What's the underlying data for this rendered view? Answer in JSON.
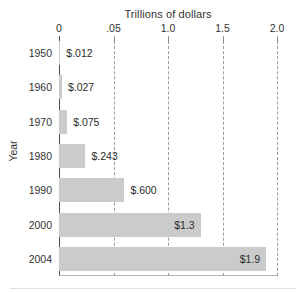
{
  "chart_data": {
    "type": "bar",
    "orientation": "horizontal",
    "title": "Trillions of dollars",
    "xlabel": "Trillions of dollars",
    "ylabel": "Year",
    "categories": [
      "1950",
      "1960",
      "1970",
      "1980",
      "1990",
      "2000",
      "2004"
    ],
    "values": [
      0.012,
      0.027,
      0.075,
      0.243,
      0.6,
      1.3,
      1.9
    ],
    "value_labels": [
      "$.012",
      "$.027",
      "$.075",
      "$.243",
      "$.600",
      "$1.3",
      "$1.9"
    ],
    "label_placement": [
      "outside",
      "outside",
      "outside",
      "outside",
      "outside",
      "inside",
      "inside"
    ],
    "xlim": [
      0,
      2.0
    ],
    "xticks": [
      0,
      0.5,
      1.0,
      1.5,
      2.0
    ],
    "xtick_labels": [
      "0",
      ".05",
      "1.0",
      "1.5",
      "2.0"
    ],
    "grid": true,
    "grid_style": "dashed",
    "legend": "none",
    "bar_color": "#cbcbcb",
    "grid_color": "#9a9a9a",
    "axis_color": "#4a4a4a",
    "text_color": "#2b2b2b",
    "background": "#ffffff"
  }
}
